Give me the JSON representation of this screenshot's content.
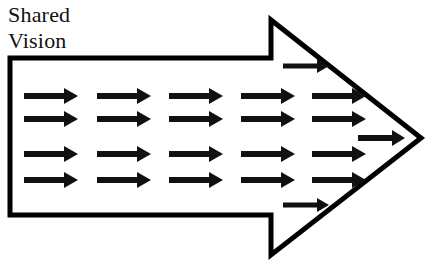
{
  "canvas": {
    "width": 439,
    "height": 266,
    "background": "#ffffff"
  },
  "label": {
    "text": "Shared\nVision",
    "lines": [
      "Shared",
      "Vision"
    ],
    "color": "#111111"
  },
  "diagram": {
    "type": "block-arrow-outline",
    "title": "Shared Vision",
    "stroke_color": "#000000",
    "fill_color": "#ffffff",
    "stroke_width": 5,
    "outline_points": "10,58 271,58 271,20 421,138 271,255 271,215 10,215",
    "arrow_color": "#111111"
  },
  "arrow_grid": {
    "rows": 4,
    "columns": 5,
    "row_y": [
      96,
      119,
      154,
      180
    ],
    "column_x": [
      24,
      97,
      169,
      241,
      312
    ],
    "shaft_length": 40,
    "shaft_thickness": 6,
    "head_length": 14,
    "head_half_height": 8
  },
  "extra_arrows": [
    {
      "name": "upper-notch-arrow",
      "x": 283,
      "y": 66,
      "shaft_length": 34,
      "shaft_thickness": 5,
      "head_length": 12,
      "head_half_height": 7
    },
    {
      "name": "lower-notch-arrow",
      "x": 283,
      "y": 205,
      "shaft_length": 34,
      "shaft_thickness": 5,
      "head_length": 12,
      "head_half_height": 7
    },
    {
      "name": "tip-arrow",
      "x": 358,
      "y": 138,
      "shaft_length": 34,
      "shaft_thickness": 6,
      "head_length": 13,
      "head_half_height": 8
    }
  ]
}
